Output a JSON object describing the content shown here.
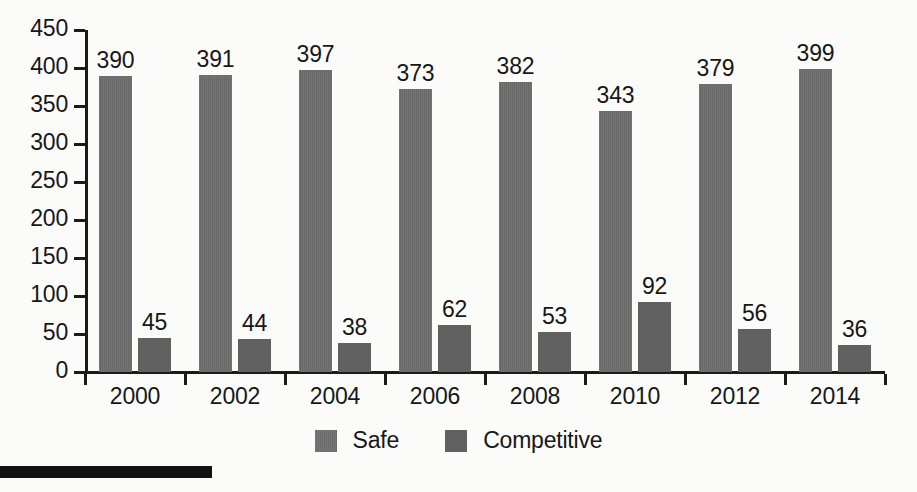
{
  "chart_data": {
    "type": "bar",
    "title": "",
    "subtitle": "",
    "xlabel": "",
    "ylabel": "",
    "categories": [
      "2000",
      "2002",
      "2004",
      "2006",
      "2008",
      "2010",
      "2012",
      "2014"
    ],
    "series": [
      {
        "name": "Safe",
        "color": "#6b6b6b",
        "values": [
          390,
          391,
          397,
          373,
          382,
          343,
          379,
          399
        ]
      },
      {
        "name": "Competitive",
        "color": "#616161",
        "values": [
          45,
          44,
          38,
          62,
          53,
          92,
          56,
          36
        ]
      }
    ],
    "ylim": [
      0,
      450
    ],
    "ytick_values": [
      0,
      50,
      100,
      150,
      200,
      250,
      300,
      350,
      400,
      450
    ],
    "ytick_labels": [
      "0",
      "50",
      "100",
      "150",
      "200",
      "250",
      "300",
      "350",
      "400",
      "450"
    ],
    "grid": false,
    "data_labels": true,
    "legend_position": "bottom-center",
    "axis_color": "#1b1b1b",
    "background_color": "#fbfbfa",
    "text_color": "#171717"
  },
  "legend": {
    "items": [
      {
        "label": "Safe",
        "swatch_name": "legend-swatch-safe"
      },
      {
        "label": "Competitive",
        "swatch_name": "legend-swatch-competitive"
      }
    ]
  },
  "decoration": {
    "bottom_rule_color": "#121212"
  }
}
